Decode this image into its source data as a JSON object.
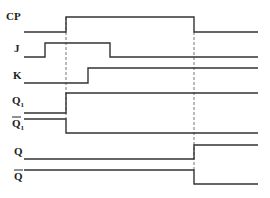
{
  "diagram": {
    "type": "jk-flip-flop-timing-diagram",
    "colors": {
      "waveform": "#333333",
      "guide": "#777777",
      "background": "#ffffff",
      "label": "#222222"
    },
    "guides": [
      {
        "name": "cp-rising-edge",
        "x": 66
      },
      {
        "name": "cp-falling-edge",
        "x": 194
      }
    ],
    "signals": [
      {
        "id": "cp",
        "label": "CP",
        "subscript": "",
        "overbar": false,
        "label_y": 20,
        "points": "24,32 66,32 66,17 194,17 194,32 258,32",
        "levels": [
          "low",
          "high",
          "low"
        ]
      },
      {
        "id": "j",
        "label": "J",
        "subscript": "",
        "overbar": false,
        "label_y": 52,
        "points": "24,57 45,57 45,43 110,43 110,57 258,57",
        "levels": [
          "low",
          "high",
          "low"
        ]
      },
      {
        "id": "k",
        "label": "K",
        "subscript": "",
        "overbar": false,
        "label_y": 79,
        "points": "24,83 88,83 88,68 258,68",
        "levels": [
          "low",
          "high"
        ]
      },
      {
        "id": "q1",
        "label": "Q",
        "subscript": "1",
        "overbar": false,
        "label_y": 104,
        "points": "24,113 66,113 66,93 258,93",
        "levels": [
          "low",
          "high"
        ]
      },
      {
        "id": "q1-bar",
        "label": "Q",
        "subscript": "1",
        "overbar": true,
        "label_y": 127,
        "points": "24,119 66,119 66,133 258,133",
        "levels": [
          "high",
          "low"
        ]
      },
      {
        "id": "q",
        "label": "Q",
        "subscript": "",
        "overbar": false,
        "label_y": 155,
        "points": "24,159 194,159 194,145 258,145",
        "levels": [
          "low",
          "high"
        ]
      },
      {
        "id": "q-bar",
        "label": "Q",
        "subscript": "",
        "overbar": true,
        "label_y": 180,
        "points": "24,170 194,170 194,184 258,184",
        "levels": [
          "high",
          "low"
        ]
      }
    ]
  }
}
